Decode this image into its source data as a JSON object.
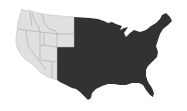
{
  "map": {
    "subject": "Contiguous United States",
    "regions": [
      {
        "name": "western-states",
        "fill": "#e0e0e0",
        "border": "#9a9a9a"
      },
      {
        "name": "central-eastern-states",
        "fill": "#323232"
      }
    ],
    "background": "#ffffff"
  }
}
